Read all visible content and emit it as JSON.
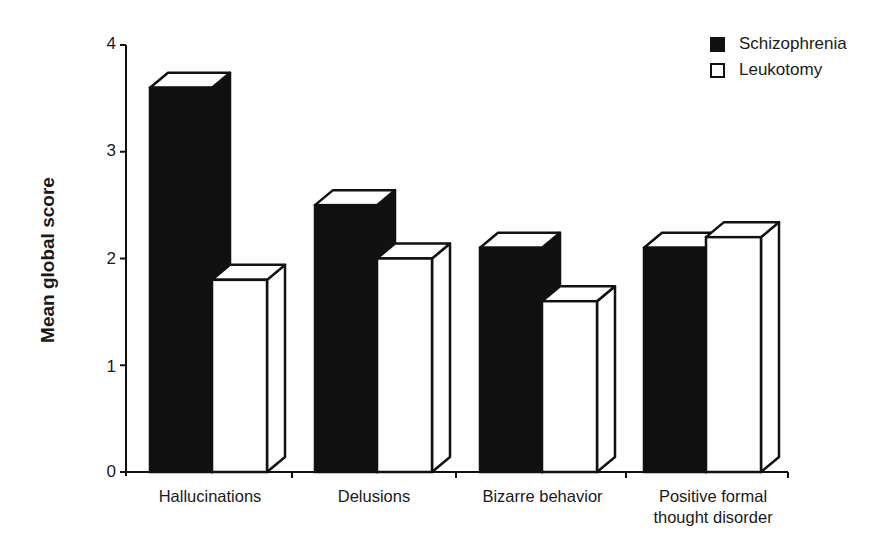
{
  "chart_data": {
    "type": "bar",
    "title": "",
    "xlabel": "",
    "ylabel": "Mean global score",
    "ylim": [
      0,
      4
    ],
    "yticks": [
      0,
      1,
      2,
      3,
      4
    ],
    "categories": [
      "Hallucinations",
      "Delusions",
      "Bizarre behavior",
      "Positive formal thought disorder"
    ],
    "category_lines": [
      [
        "Hallucinations"
      ],
      [
        "Delusions"
      ],
      [
        "Bizarre behavior"
      ],
      [
        "Positive formal",
        "thought disorder"
      ]
    ],
    "series": [
      {
        "name": "Schizophrenia",
        "color": "#111111",
        "values": [
          3.6,
          2.5,
          2.1,
          2.1
        ]
      },
      {
        "name": "Leukotomy",
        "color": "#ffffff",
        "values": [
          1.8,
          2.0,
          1.6,
          2.2
        ]
      }
    ],
    "legend_position": "top-right",
    "grid": false,
    "style": "3d-bars"
  },
  "legend": {
    "items": [
      {
        "label": "Schizophrenia",
        "fill": "#111111"
      },
      {
        "label": "Leukotomy",
        "fill": "#ffffff"
      }
    ]
  },
  "axis": {
    "ylabel": "Mean global score",
    "ticks": [
      "0",
      "1",
      "2",
      "3",
      "4"
    ]
  },
  "categories": {
    "c0": {
      "l1": "Hallucinations",
      "l2": ""
    },
    "c1": {
      "l1": "Delusions",
      "l2": ""
    },
    "c2": {
      "l1": "Bizarre behavior",
      "l2": ""
    },
    "c3": {
      "l1": "Positive formal",
      "l2": "thought disorder"
    }
  }
}
